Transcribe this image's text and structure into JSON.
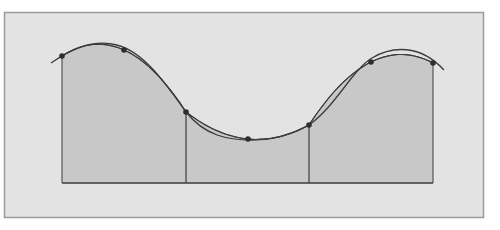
{
  "diagram": {
    "colors": {
      "page": "#ffffff",
      "frame_fill": "#e3e3e3",
      "frame_border": "#9a9a9a",
      "region_fill": "#c8c8c8",
      "line": "#3c3c3c",
      "point": "#2e2e2e"
    },
    "frame": {
      "x": 4,
      "y": 12,
      "width": 479,
      "height": 205
    },
    "baseline_y": 183,
    "points": [
      {
        "x": 62,
        "y": 56
      },
      {
        "x": 124,
        "y": 50
      },
      {
        "x": 186,
        "y": 112
      },
      {
        "x": 248,
        "y": 139
      },
      {
        "x": 309,
        "y": 125
      },
      {
        "x": 371,
        "y": 62
      },
      {
        "x": 433,
        "y": 63
      }
    ],
    "dividers_x": [
      186,
      309
    ],
    "curve_path": "M51,63 C70,50 90,40 112,44 C140,48 162,78 186,112 C205,136 228,140 252,140 C276,140 296,132 309,125 C336,106 352,70 372,58 C392,46 420,44 444,70",
    "parabola_segments": [
      {
        "x0": 62,
        "x1": 124,
        "x2": 186
      },
      {
        "x0": 186,
        "x1": 248,
        "x2": 309
      },
      {
        "x0": 309,
        "x1": 371,
        "x2": 433
      }
    ],
    "labels": []
  }
}
